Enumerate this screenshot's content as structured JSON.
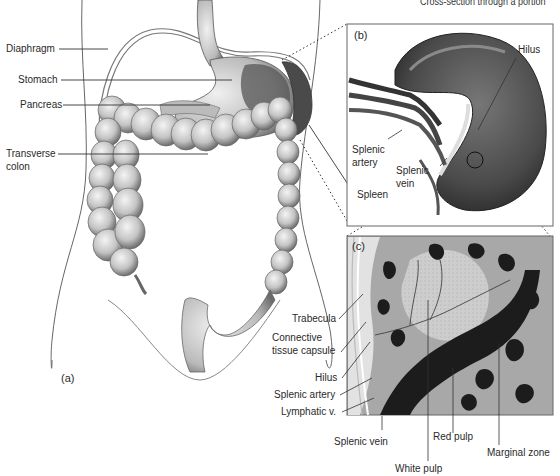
{
  "caption": "Cross-section through a portion",
  "panel_a": {
    "letter": "(a)",
    "labels": {
      "diaphragm": "Diaphragm",
      "stomach": "Stomach",
      "pancreas": "Pancreas",
      "transverse_colon_1": "Transverse",
      "transverse_colon_2": "colon",
      "spleen": "Spleen"
    }
  },
  "panel_b": {
    "letter": "(b)",
    "labels": {
      "hilus": "Hilus",
      "splenic_artery_1": "Splenic",
      "splenic_artery_2": "artery",
      "splenic_vein_1": "Splenic",
      "splenic_vein_2": "vein"
    }
  },
  "panel_c": {
    "letter": "(c)",
    "labels": {
      "trabecula": "Trabecula",
      "connective_1": "Connective",
      "connective_2": "tissue capsule",
      "hilus": "Hilus",
      "splenic_artery": "Splenic artery",
      "lymphatic": "Lymphatic v.",
      "splenic_vein": "Splenic vein",
      "red_pulp": "Red pulp",
      "white_pulp": "White pulp",
      "marginal_zone": "Marginal zone"
    }
  },
  "colors": {
    "ink": "#2a2a2a",
    "organ_light": "#d9d9d9",
    "organ_mid": "#9a9a9a",
    "organ_dark": "#3a3a3a",
    "tissue_bg": "#a8a8a8",
    "white_pulp": "#cfcfcf"
  }
}
